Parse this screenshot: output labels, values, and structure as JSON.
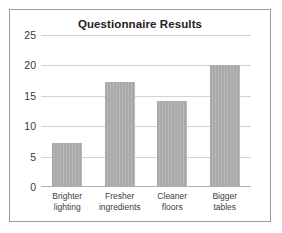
{
  "chart_data": {
    "type": "bar",
    "title": "Questionnaire Results",
    "xlabel": "",
    "ylabel": "",
    "categories": [
      "Brighter lighting",
      "Fresher ingredients",
      "Cleaner floors",
      "Bigger tables"
    ],
    "category_lines": [
      [
        "Brighter",
        "lighting"
      ],
      [
        "Fresher",
        "ingredients"
      ],
      [
        "Cleaner",
        "floors"
      ],
      [
        "Bigger",
        "tables"
      ]
    ],
    "values": [
      7.2,
      17.3,
      14.2,
      20.0
    ],
    "ylim": [
      0,
      25
    ],
    "yticks": [
      0,
      5,
      10,
      15,
      20,
      25
    ],
    "ytick_labels": [
      "0",
      "5",
      "10",
      "15",
      "20",
      "25"
    ],
    "grid": true,
    "legend": false,
    "bar_color": "#a9a9a9",
    "grid_color": "#d2d2d2",
    "axis_color": "#b0b0b0",
    "border_color": "#9b9b9b",
    "background_color": "#ffffff"
  }
}
